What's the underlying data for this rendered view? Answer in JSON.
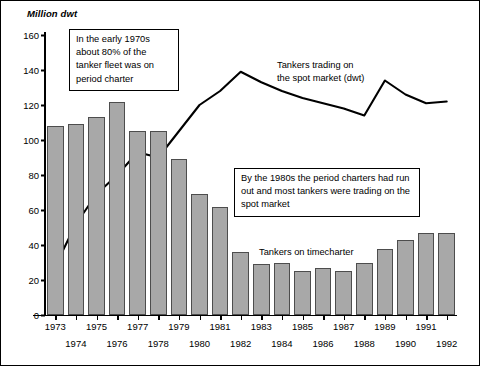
{
  "chart_data": {
    "type": "bar",
    "title": "",
    "subtitle": "",
    "xlabel": "",
    "ylabel": "Million dwt",
    "ylim": [
      0,
      160
    ],
    "yticks": [
      0,
      20,
      40,
      60,
      80,
      100,
      120,
      140,
      160
    ],
    "grid": false,
    "legend_position": "inline-annotations",
    "categories": [
      "1973",
      "1974",
      "1975",
      "1976",
      "1977",
      "1978",
      "1979",
      "1980",
      "1981",
      "1982",
      "1983",
      "1984",
      "1985",
      "1986",
      "1987",
      "1988",
      "1989",
      "1990",
      "1991",
      "1992"
    ],
    "series": [
      {
        "name": "Tankers on timecharter",
        "type": "bar",
        "values": [
          108,
          109,
          113,
          122,
          105,
          105,
          89,
          69,
          62,
          36,
          29,
          30,
          25,
          27,
          25,
          30,
          38,
          43,
          47,
          47
        ]
      },
      {
        "name": "Tankers trading on the spot market (dwt)",
        "type": "line",
        "values": [
          28,
          52,
          69,
          80,
          93,
          90,
          105,
          120,
          128,
          139,
          133,
          128,
          124,
          121,
          118,
          114,
          134,
          126,
          121,
          122
        ]
      }
    ]
  },
  "axis": {
    "y_title": "Million dwt",
    "y_ticks": [
      "160",
      "140",
      "120",
      "100",
      "80",
      "60",
      "40",
      "20",
      "0"
    ],
    "x_ticks_top_row": [
      "1973",
      "1975",
      "1977",
      "1979",
      "1981",
      "1983",
      "1985",
      "1987",
      "1989",
      "1991"
    ],
    "x_ticks_bottom_row": [
      "1974",
      "1976",
      "1978",
      "1980",
      "1982",
      "1984",
      "1986",
      "1988",
      "1990",
      "1992"
    ]
  },
  "annotations": {
    "callout_1": "In the early 1970s about 80% of the tanker fleet was on period charter",
    "callout_2": "By the 1980s the period charters had run out and most tankers were trading on the spot market",
    "label_spot": "Tankers trading on\nthe spot market (dwt)",
    "label_timecharter": "Tankers on timecharter"
  },
  "colors": {
    "bar_fill": "#a8a8a8",
    "bar_stroke": "#4d4d4d",
    "line_stroke": "#000000",
    "axis": "#000000",
    "background": "#ffffff"
  }
}
